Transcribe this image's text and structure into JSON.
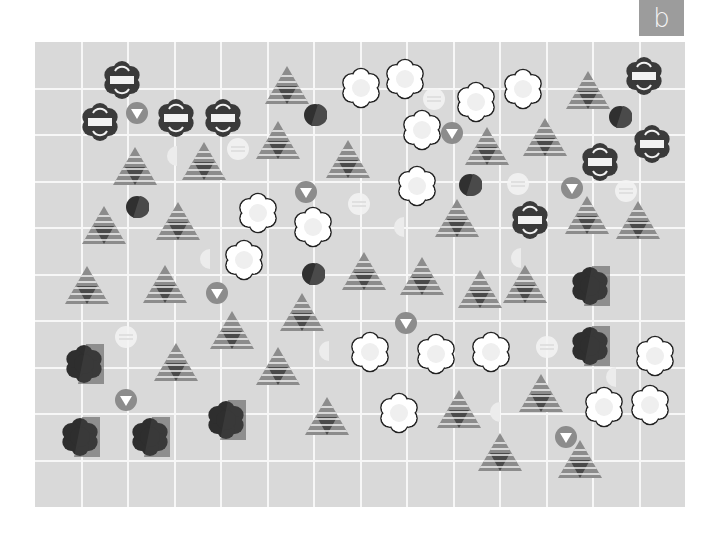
{
  "panel_label": "b",
  "colors": {
    "board": "#d9d9d9",
    "grid_line": "#f7f7f7",
    "label_bg": "#9c9c9c",
    "dark": "#3a3a3a",
    "mid": "#8c8c8c",
    "light": "#f2f2f2",
    "white": "#ffffff"
  },
  "grid": {
    "columns": 14,
    "rows": 10,
    "cell_w": 46.5,
    "cell_h": 46.5
  },
  "pieces": {
    "banded_dark_flower": [
      [
        122,
        80
      ],
      [
        100,
        122
      ],
      [
        176,
        118
      ],
      [
        223,
        118
      ],
      [
        644,
        76
      ],
      [
        652,
        144
      ],
      [
        600,
        162
      ],
      [
        530,
        220
      ]
    ],
    "white_flower": [
      [
        361,
        88
      ],
      [
        405,
        79
      ],
      [
        476,
        102
      ],
      [
        523,
        89
      ],
      [
        422,
        130
      ],
      [
        417,
        186
      ],
      [
        258,
        213
      ],
      [
        313,
        227
      ],
      [
        244,
        260
      ],
      [
        370,
        352
      ],
      [
        436,
        354
      ],
      [
        491,
        352
      ],
      [
        399,
        413
      ],
      [
        655,
        356
      ],
      [
        604,
        407
      ],
      [
        650,
        405
      ]
    ],
    "dark_flower": [
      [
        590,
        286
      ],
      [
        590,
        346
      ],
      [
        84,
        364
      ],
      [
        80,
        437
      ],
      [
        150,
        437
      ],
      [
        226,
        420
      ]
    ],
    "striped_triangle": [
      [
        287,
        86
      ],
      [
        588,
        91
      ],
      [
        135,
        167
      ],
      [
        204,
        162
      ],
      [
        278,
        141
      ],
      [
        348,
        160
      ],
      [
        487,
        147
      ],
      [
        545,
        138
      ],
      [
        104,
        226
      ],
      [
        178,
        222
      ],
      [
        457,
        219
      ],
      [
        587,
        216
      ],
      [
        638,
        221
      ],
      [
        87,
        286
      ],
      [
        165,
        285
      ],
      [
        364,
        272
      ],
      [
        422,
        277
      ],
      [
        480,
        290
      ],
      [
        525,
        285
      ],
      [
        232,
        331
      ],
      [
        302,
        313
      ],
      [
        176,
        363
      ],
      [
        278,
        367
      ],
      [
        327,
        417
      ],
      [
        459,
        410
      ],
      [
        541,
        394
      ],
      [
        500,
        453
      ],
      [
        580,
        460
      ]
    ],
    "down_arrow_circle": [
      [
        137,
        113
      ],
      [
        452,
        133
      ],
      [
        306,
        192
      ],
      [
        572,
        188
      ],
      [
        217,
        293
      ],
      [
        406,
        323
      ],
      [
        126,
        400
      ],
      [
        566,
        437
      ]
    ],
    "dark_circle": [
      [
        315,
        115
      ],
      [
        620,
        117
      ],
      [
        137,
        207
      ],
      [
        470,
        185
      ],
      [
        313,
        274
      ]
    ],
    "pale_lined_circle": [
      [
        434,
        99
      ],
      [
        238,
        149
      ],
      [
        518,
        184
      ],
      [
        359,
        204
      ],
      [
        626,
        191
      ],
      [
        126,
        337
      ],
      [
        547,
        347
      ]
    ],
    "faint_half_moon": [
      [
        174,
        156
      ],
      [
        401,
        227
      ],
      [
        207,
        259
      ],
      [
        518,
        258
      ],
      [
        326,
        351
      ],
      [
        497,
        412
      ],
      [
        613,
        377
      ]
    ]
  }
}
